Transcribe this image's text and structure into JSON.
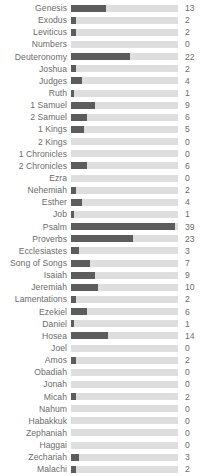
{
  "chart_data": {
    "type": "bar",
    "orientation": "horizontal",
    "title": "",
    "subtitle": "",
    "xlabel": "",
    "ylabel": "",
    "grid": false,
    "legend": null,
    "xlim": [
      0,
      40
    ],
    "value_labels_shown": true,
    "colors": {
      "bar_fill": "#5c5c5c",
      "bar_track": "#dedede",
      "label_text": "#6b6b6b",
      "value_text": "#6b6b6b",
      "background": "#ffffff"
    },
    "categories": [
      "Genesis",
      "Exodus",
      "Leviticus",
      "Numbers",
      "Deuteronomy",
      "Joshua",
      "Judges",
      "Ruth",
      "1 Samuel",
      "2 Samuel",
      "1 Kings",
      "2 Kings",
      "1 Chronicles",
      "2 Chronicles",
      "Ezra",
      "Nehemiah",
      "Esther",
      "Job",
      "Psalm",
      "Proverbs",
      "Ecclesiastes",
      "Song of Songs",
      "Isaiah",
      "Jeremiah",
      "Lamentations",
      "Ezekiel",
      "Daniel",
      "Hosea",
      "Joel",
      "Amos",
      "Obadiah",
      "Jonah",
      "Micah",
      "Nahum",
      "Habakkuk",
      "Zephaniah",
      "Haggai",
      "Zechariah",
      "Malachi"
    ],
    "values": [
      13,
      2,
      2,
      0,
      22,
      2,
      4,
      1,
      9,
      6,
      5,
      0,
      0,
      6,
      0,
      2,
      4,
      1,
      39,
      23,
      3,
      7,
      9,
      10,
      2,
      6,
      1,
      14,
      0,
      2,
      0,
      0,
      2,
      0,
      0,
      0,
      0,
      3,
      2
    ]
  }
}
